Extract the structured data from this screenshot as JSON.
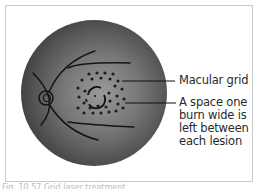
{
  "figure": {
    "labels": {
      "macular_grid": "Macular grid",
      "spacing_note": "A space one burn wide is left between each lesion"
    },
    "caption": "Fig. 10.57 Grid laser treatment",
    "colors": {
      "fundus_dark": "#3d3d3d",
      "fundus_light": "#8a8a8a",
      "vessel": "#1a1a1a",
      "burn": "#1f1f1f",
      "frame_border": "#c9c9c9",
      "text": "#2a2a2a"
    }
  }
}
